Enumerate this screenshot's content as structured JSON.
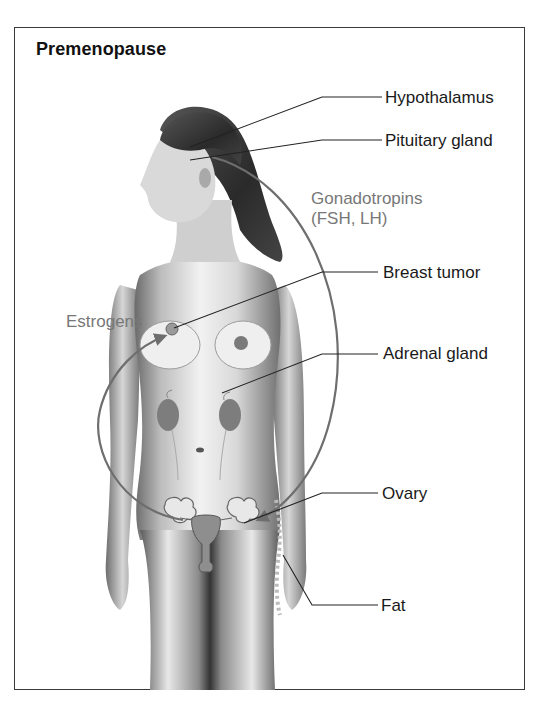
{
  "title": "Premenopause",
  "labels": {
    "hypothalamus": "Hypothalamus",
    "pituitary": "Pituitary gland",
    "breast_tumor": "Breast tumor",
    "adrenal": "Adrenal gland",
    "ovary": "Ovary",
    "fat": "Fat"
  },
  "hormones": {
    "gonadotropins_line1": "Gonadotropins",
    "gonadotropins_line2": "(FSH, LH)",
    "estrogens": "Estrogens"
  },
  "colors": {
    "frame": "#3a3a3a",
    "label_text": "#1a1a1a",
    "hormone_text": "#777777",
    "arrow": "#6e6e6e",
    "leader_line": "#222222"
  }
}
